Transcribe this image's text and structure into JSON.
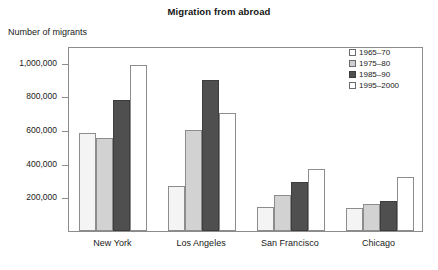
{
  "chart_data": {
    "type": "bar",
    "title": "Migration from abroad",
    "ylabel": "Number of migrants",
    "xlabel": "",
    "categories": [
      "New York",
      "Los Angeles",
      "San Francisco",
      "Chicago"
    ],
    "series": [
      {
        "name": "1965–70",
        "values": [
          585000,
          270000,
          140000,
          135000
        ]
      },
      {
        "name": "1975–80",
        "values": [
          555000,
          600000,
          215000,
          160000
        ]
      },
      {
        "name": "1985–90",
        "values": [
          780000,
          900000,
          290000,
          180000
        ]
      },
      {
        "name": "1995–2000",
        "values": [
          990000,
          700000,
          370000,
          320000
        ]
      }
    ],
    "ylim": [
      0,
      1100000
    ],
    "yticks": [
      200000,
      400000,
      600000,
      800000,
      1000000
    ],
    "ytick_labels": [
      "200,000",
      "400,000",
      "600,000",
      "800,000",
      "1,000,000"
    ],
    "grid": false,
    "legend_position": "top-right",
    "colors": {
      "series_1965_70": "#f4f4f4",
      "series_1975_80": "#d2d2d2",
      "series_1985_90": "#4f4f4f",
      "series_1995_2000": "#ffffff",
      "axis": "#8c8c8c",
      "text": "#1a1a1a"
    }
  }
}
